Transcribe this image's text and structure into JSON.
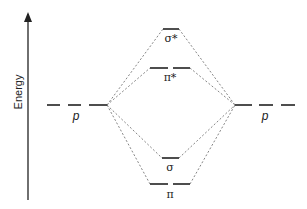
{
  "diagram": {
    "type": "molecular-orbital-energy-diagram",
    "axis": {
      "label": "Energy",
      "direction": "up"
    },
    "atomic_orbitals": {
      "left": {
        "label": "p",
        "count": 3
      },
      "right": {
        "label": "p",
        "count": 3
      }
    },
    "molecular_orbitals": [
      {
        "id": "sigma_star",
        "label": "σ*",
        "degeneracy": 1,
        "order": 1
      },
      {
        "id": "pi_star",
        "label": "π*",
        "degeneracy": 2,
        "order": 2
      },
      {
        "id": "sigma",
        "label": "σ",
        "degeneracy": 1,
        "order": 3
      },
      {
        "id": "pi",
        "label": "π",
        "degeneracy": 2,
        "order": 4
      }
    ],
    "colors": {
      "line": "#222222",
      "dotted": "#777777"
    }
  }
}
